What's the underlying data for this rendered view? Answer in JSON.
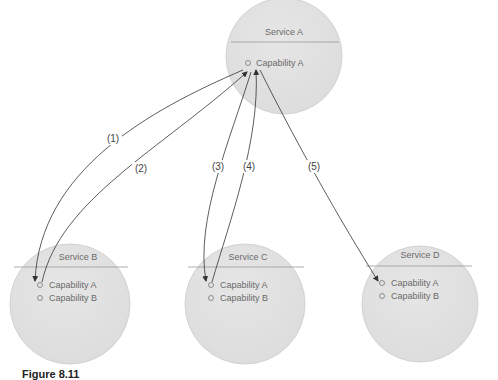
{
  "services": [
    {
      "id": "A",
      "title": "Service A",
      "cx": 284,
      "cy": 56,
      "r": 58,
      "capabilities": [
        "Capability A"
      ]
    },
    {
      "id": "B",
      "title": "Service B",
      "cx": 70,
      "cy": 304,
      "r": 60,
      "capabilities": [
        "Capability A",
        "Capability B"
      ]
    },
    {
      "id": "C",
      "title": "Service C",
      "cx": 245,
      "cy": 304,
      "r": 60,
      "capabilities": [
        "Capability A",
        "Capability B"
      ]
    },
    {
      "id": "D",
      "title": "Service D",
      "cx": 420,
      "cy": 304,
      "r": 58,
      "capabilities": [
        "Capability A",
        "Capability B"
      ]
    }
  ],
  "arrows": [
    {
      "label": "(1)",
      "from": "A",
      "to": "B",
      "direction": "A-to-B"
    },
    {
      "label": "(2)",
      "from": "B",
      "to": "A",
      "direction": "B-to-A"
    },
    {
      "label": "(3)",
      "from": "A",
      "to": "C",
      "direction": "A-to-C"
    },
    {
      "label": "(4)",
      "from": "C",
      "to": "A",
      "direction": "C-to-A"
    },
    {
      "label": "(5)",
      "from": "A",
      "to": "D",
      "direction": "A-to-D"
    }
  ],
  "caption": "Figure 8.11",
  "colors": {
    "circle_fill": "#e2e2e2",
    "circle_stroke": "#cfcfcf",
    "arrow": "#333333",
    "text": "#6a6a6a"
  }
}
